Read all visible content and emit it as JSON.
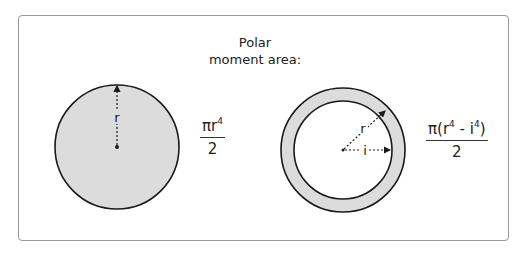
{
  "title": {
    "line1": "Polar",
    "line2": "moment area:"
  },
  "solid_circle": {
    "radius_label": "r",
    "formula": {
      "numerator_prefix": "πr",
      "numerator_exp": "4",
      "denominator": "2"
    }
  },
  "hollow_circle": {
    "outer_radius_label": "r",
    "inner_radius_label": "i",
    "formula": {
      "numerator_prefix": "π(r",
      "numerator_exp1": "4",
      "numerator_mid": " - i",
      "numerator_exp2": "4",
      "numerator_suffix": ")",
      "denominator": "2"
    }
  },
  "colors": {
    "fill": "#dcdcdc",
    "stroke": "#1a1a1a",
    "frame": "#9a9a9a"
  }
}
